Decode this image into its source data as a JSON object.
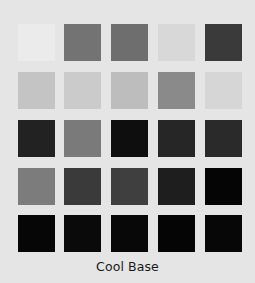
{
  "palette": {
    "title": "Cool Base",
    "background": "#e5e5e5",
    "rows": [
      [
        "#ebebeb",
        "#737373",
        "#6e6e6e",
        "#d8d8d8",
        "#3a3a3a"
      ],
      [
        "#c4c4c4",
        "#cbcbcb",
        "#bdbdbd",
        "#8a8a8a",
        "#d6d6d6"
      ],
      [
        "#222222",
        "#7a7a7a",
        "#0e0e0e",
        "#262626",
        "#2a2a2a"
      ],
      [
        "#7c7c7c",
        "#3a3a3a",
        "#3f3f3f",
        "#1e1e1e",
        "#050505"
      ],
      [
        "#060606",
        "#0a0a0a",
        "#080808",
        "#050505",
        "#070707"
      ]
    ]
  }
}
